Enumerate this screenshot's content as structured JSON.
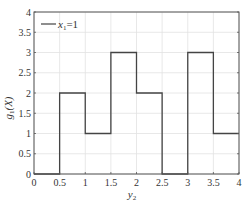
{
  "chart_data": {
    "type": "line",
    "style": "step",
    "title": "",
    "xlabel": "y2",
    "ylabel": "g1(X)",
    "xlim": [
      0,
      4
    ],
    "ylim": [
      0,
      4
    ],
    "grid": true,
    "legend_position": "upper left",
    "x_ticks": [
      "0",
      "0.5",
      "1",
      "1.5",
      "2",
      "2.5",
      "3",
      "3.5",
      "4"
    ],
    "y_ticks": [
      "0",
      "0.5",
      "1",
      "1.5",
      "2",
      "2.5",
      "3",
      "3.5",
      "4"
    ],
    "series": [
      {
        "name": "x1=1",
        "color": "#444444",
        "x": [
          0,
          0.5,
          1,
          1.5,
          2,
          2.5,
          3,
          3.5
        ],
        "x_end": [
          0.5,
          1,
          1.5,
          2,
          2.5,
          3,
          3.5,
          4
        ],
        "values": [
          0,
          2,
          1,
          3,
          2,
          0,
          3,
          1
        ]
      }
    ]
  },
  "labels": {
    "xlabel_main": "y",
    "xlabel_sub": "2",
    "ylabel_main": "g",
    "ylabel_sub": "1",
    "ylabel_arg": "(X)",
    "legend_main": "x",
    "legend_sub": "1",
    "legend_rest": "=1"
  }
}
